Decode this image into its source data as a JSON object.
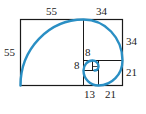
{
  "diagram": {
    "colors": {
      "lines": "#1a1a1a",
      "spiral": "#2a8fc4"
    },
    "labels": {
      "top_left": "55",
      "top_right": "34",
      "left": "55",
      "right_upper": "34",
      "right_lower": "21",
      "inner_top": "8",
      "inner_left": "8",
      "bottom_left": "13",
      "bottom_right": "21"
    },
    "squares": [
      55,
      34,
      21,
      13,
      8,
      5,
      3,
      2,
      1,
      1
    ]
  }
}
